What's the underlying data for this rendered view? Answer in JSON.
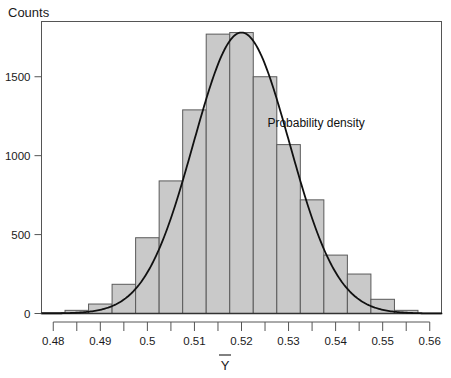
{
  "chart_data": {
    "type": "bar",
    "title": "",
    "xlabel": "Ȳ",
    "ylabel": "Counts",
    "xlim": [
      0.4775,
      0.5625
    ],
    "ylim": [
      0,
      1850
    ],
    "grid": false,
    "legend_position": "none",
    "bin_width": 0.005,
    "bin_starts": [
      0.4775,
      0.4825,
      0.4875,
      0.4925,
      0.4975,
      0.5025,
      0.5075,
      0.5125,
      0.5175,
      0.5225,
      0.5275,
      0.5325,
      0.5375,
      0.5425,
      0.5475,
      0.5525
    ],
    "categories": [
      "0.4775-0.4825",
      "0.4825-0.4875",
      "0.4875-0.4925",
      "0.4925-0.4975",
      "0.4975-0.5025",
      "0.5025-0.5075",
      "0.5075-0.5125",
      "0.5125-0.5175",
      "0.5175-0.5225",
      "0.5225-0.5275",
      "0.5275-0.5325",
      "0.5325-0.5375",
      "0.5375-0.5425",
      "0.5425-0.5475",
      "0.5475-0.5525",
      "0.5525-0.5575"
    ],
    "values": [
      5,
      20,
      60,
      185,
      480,
      840,
      1290,
      1770,
      1780,
      1500,
      1070,
      720,
      370,
      250,
      90,
      20
    ],
    "xticks": [
      0.48,
      0.485,
      0.49,
      0.495,
      0.5,
      0.505,
      0.51,
      0.515,
      0.52,
      0.525,
      0.53,
      0.535,
      0.54,
      0.545,
      0.55,
      0.555,
      0.56
    ],
    "xtick_labels": [
      "0.48",
      "",
      "0.49",
      "",
      "0.5",
      "",
      "0.51",
      "",
      "0.52",
      "",
      "0.53",
      "",
      "0.54",
      "",
      "0.55",
      "",
      "0.56"
    ],
    "yticks": [
      0,
      500,
      1000,
      1500
    ],
    "ytick_labels": [
      "0",
      "500",
      "1000",
      "1500"
    ],
    "annotations": [
      {
        "text": "Probability density",
        "x": 0.5255,
        "y": 1180
      }
    ],
    "series": [
      {
        "name": "Probability density",
        "type": "line",
        "mean": 0.52,
        "sd": 0.0102,
        "peak_value": 1780
      }
    ],
    "colors": {
      "bar_fill": "#c9c9c9",
      "bar_stroke": "#5a5a5a",
      "curve": "#111111",
      "frame": "#555555",
      "text": "#1a1a1a"
    }
  }
}
